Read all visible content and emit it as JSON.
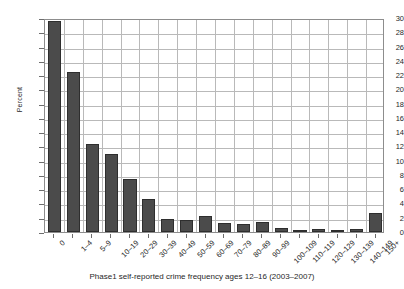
{
  "chart_data": {
    "type": "bar",
    "title": "",
    "xlabel": "Phase1 self-reported crime frequency ages 12–16 (2003–2007)",
    "ylabel": "Percent",
    "ylim": [
      0,
      30
    ],
    "ytick_step": 2,
    "yticks": [
      0,
      2,
      4,
      6,
      8,
      10,
      12,
      14,
      16,
      18,
      20,
      22,
      24,
      26,
      28,
      30
    ],
    "ytick_labels": [
      "0",
      "2",
      "4",
      "6",
      "8",
      "10",
      "12",
      "14",
      "16",
      "18",
      "20",
      "22",
      "24",
      "26",
      "28",
      "30"
    ],
    "grid": true,
    "legend": null,
    "bar_color": "#4b4b4b",
    "bar_edge_color": "#2e2e2e",
    "grid_color": "#b9b9b9",
    "frame_color": "#8d8d8d",
    "categories": [
      "0",
      "1–4",
      "5–9",
      "10–19",
      "20–29",
      "30–39",
      "40–49",
      "50–59",
      "60–69",
      "70–79",
      "80–89",
      "90–99",
      "100–109",
      "110–119",
      "120–129",
      "130–139",
      "140–149",
      "150+"
    ],
    "values": [
      29.6,
      22.4,
      12.3,
      11.0,
      7.4,
      4.6,
      1.8,
      1.7,
      2.2,
      1.3,
      1.1,
      1.4,
      0.5,
      0.25,
      0.4,
      0.25,
      0.4,
      2.7
    ]
  }
}
